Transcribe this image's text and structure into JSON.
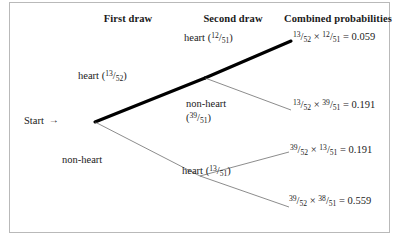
{
  "figure": {
    "type": "probability-tree",
    "headers": {
      "first_draw": "First draw",
      "second_draw": "Second draw",
      "combined": "Combined probabilities"
    },
    "start": {
      "label": "Start",
      "arrow": "→"
    },
    "branches": {
      "first_heart": {
        "name": "heart",
        "open_paren": "(",
        "num": "13",
        "bar": "/",
        "den": "52",
        "close_paren": ")"
      },
      "first_nonheart": {
        "name": "non-heart"
      },
      "second_heart_top": {
        "name": "heart",
        "open_paren": "(",
        "num": "12",
        "bar": "/",
        "den": "51",
        "close_paren": ")"
      },
      "second_nonheart_top": {
        "name": "non-heart",
        "open_paren": "(",
        "num": "39",
        "bar": "/",
        "den": "51",
        "close_paren": ")"
      },
      "second_heart_bottom": {
        "name": "heart",
        "open_paren": "(",
        "num": "13",
        "bar": "/",
        "den": "51",
        "close_paren": ")"
      }
    },
    "outcomes": [
      {
        "n1": "13",
        "d1": "52",
        "times": "×",
        "n2": "12",
        "d2": "51",
        "equals": "=",
        "value": "0.059",
        "highlighted": true
      },
      {
        "n1": "13",
        "d1": "52",
        "times": "×",
        "n2": "39",
        "d2": "51",
        "equals": "=",
        "value": "0.191",
        "highlighted": false
      },
      {
        "n1": "39",
        "d1": "52",
        "times": "×",
        "n2": "13",
        "d2": "51",
        "equals": "=",
        "value": "0.191",
        "highlighted": false
      },
      {
        "n1": "39",
        "d1": "52",
        "times": "×",
        "n2": "38",
        "d2": "51",
        "equals": "=",
        "value": "0.559",
        "highlighted": false
      }
    ],
    "colors": {
      "ink": "#1a1a1a",
      "line": "#5a5a5a",
      "bold_line": "#000000",
      "border": "#b9b9b9",
      "background": "#ffffff"
    }
  }
}
